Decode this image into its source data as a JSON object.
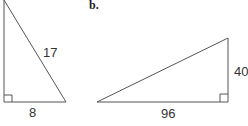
{
  "figure": {
    "part_label": "b.",
    "triangle_a": {
      "hypotenuse_label": "17",
      "base_label": "8",
      "right_angle": "bottom-left"
    },
    "triangle_b": {
      "base_label": "96",
      "height_label": "40",
      "right_angle": "bottom-right"
    },
    "stroke_color": "#555555"
  }
}
